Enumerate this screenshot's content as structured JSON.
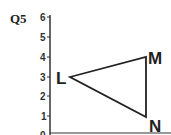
{
  "question_label": "Q5",
  "axis": {
    "y_ticks": [
      "0",
      "1",
      "2",
      "3",
      "4",
      "5",
      "6"
    ]
  },
  "points": [
    {
      "label": "L",
      "x": 1,
      "y": 3
    },
    {
      "label": "M",
      "x": 5,
      "y": 4
    },
    {
      "label": "N",
      "x": 5,
      "y": 1
    }
  ]
}
